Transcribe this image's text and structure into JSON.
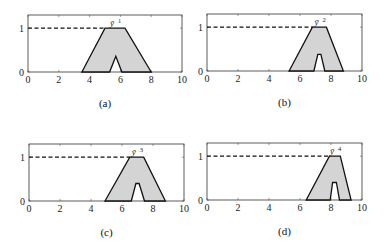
{
  "chart_data": [
    {
      "type": "area",
      "panel_label": "(a)",
      "title": "",
      "peak_label": "ȳ",
      "peak_sup": "1",
      "xlabel": "",
      "ylabel": "",
      "xlim": [
        0,
        10
      ],
      "ylim": [
        0,
        1.3
      ],
      "xticks": [
        0,
        2,
        4,
        6,
        8,
        10
      ],
      "yticks": [
        0,
        1
      ],
      "reference_line": {
        "y": 1,
        "style": "dashed",
        "from_x": 0
      },
      "grid": false,
      "polygon": [
        [
          3.5,
          0
        ],
        [
          5.0,
          1
        ],
        [
          6.3,
          1
        ],
        [
          8.0,
          0
        ],
        [
          6.1,
          0
        ],
        [
          5.7,
          0.36
        ],
        [
          5.3,
          0
        ]
      ],
      "fill": "#d4d4d4",
      "stroke": "#111111"
    },
    {
      "type": "area",
      "panel_label": "(b)",
      "title": "",
      "peak_label": "ȳ",
      "peak_sup": "2",
      "xlabel": "",
      "ylabel": "",
      "xlim": [
        0,
        10
      ],
      "ylim": [
        0,
        1.3
      ],
      "xticks": [
        0,
        2,
        4,
        6,
        8,
        10
      ],
      "yticks": [
        0,
        1
      ],
      "reference_line": {
        "y": 1,
        "style": "dashed",
        "from_x": 0
      },
      "grid": false,
      "polygon": [
        [
          5.3,
          0
        ],
        [
          6.8,
          1
        ],
        [
          7.7,
          1
        ],
        [
          8.8,
          0
        ],
        [
          7.6,
          0
        ],
        [
          7.35,
          0.38
        ],
        [
          7.15,
          0.38
        ],
        [
          6.9,
          0
        ]
      ],
      "fill": "#d4d4d4",
      "stroke": "#111111"
    },
    {
      "type": "area",
      "panel_label": "(c)",
      "title": "",
      "peak_label": "ȳ",
      "peak_sup": "3",
      "xlabel": "",
      "ylabel": "",
      "xlim": [
        0,
        10
      ],
      "ylim": [
        0,
        1.3
      ],
      "xticks": [
        0,
        2,
        4,
        6,
        8,
        10
      ],
      "yticks": [
        0,
        1
      ],
      "reference_line": {
        "y": 1,
        "style": "dashed",
        "from_x": 0
      },
      "grid": false,
      "polygon": [
        [
          4.9,
          0
        ],
        [
          6.5,
          1
        ],
        [
          7.4,
          1
        ],
        [
          8.8,
          0
        ],
        [
          7.45,
          0
        ],
        [
          7.1,
          0.4
        ],
        [
          6.9,
          0.4
        ],
        [
          6.6,
          0
        ]
      ],
      "fill": "#d4d4d4",
      "stroke": "#111111"
    },
    {
      "type": "area",
      "panel_label": "(d)",
      "title": "",
      "peak_label": "ȳ",
      "peak_sup": "4",
      "xlabel": "",
      "ylabel": "",
      "xlim": [
        0,
        10
      ],
      "ylim": [
        0,
        1.3
      ],
      "xticks": [
        0,
        2,
        4,
        6,
        8,
        10
      ],
      "yticks": [
        0,
        1
      ],
      "reference_line": {
        "y": 1,
        "style": "dashed",
        "from_x": 0
      },
      "grid": false,
      "polygon": [
        [
          6.4,
          0
        ],
        [
          7.9,
          1
        ],
        [
          8.6,
          1
        ],
        [
          9.3,
          0
        ],
        [
          8.55,
          0
        ],
        [
          8.35,
          0.4
        ],
        [
          8.1,
          0.4
        ],
        [
          7.95,
          0
        ]
      ],
      "fill": "#d4d4d4",
      "stroke": "#111111"
    }
  ],
  "layout": [
    {
      "left": 28,
      "top": 15,
      "width": 154,
      "height": 57,
      "caption_top": 97
    },
    {
      "left": 207,
      "top": 14,
      "width": 155,
      "height": 57,
      "caption_top": 96
    },
    {
      "left": 29,
      "top": 144,
      "width": 155,
      "height": 57,
      "caption_top": 226
    },
    {
      "left": 207,
      "top": 143,
      "width": 155,
      "height": 57,
      "caption_top": 225
    }
  ]
}
